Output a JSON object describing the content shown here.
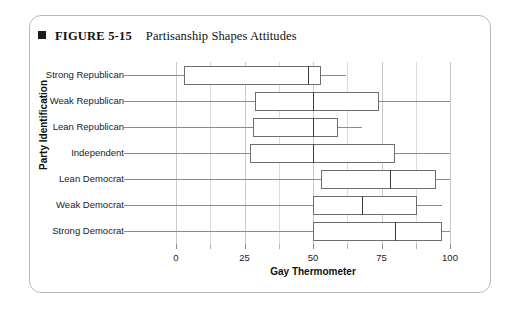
{
  "figure": {
    "bullet_icon": "filled-square-icon",
    "number": "FIGURE 5-15",
    "title": "Partisanship Shapes Attitudes"
  },
  "chart_data": {
    "type": "box",
    "title": "Partisanship Shapes Attitudes",
    "xlabel": "Gay Thermometer",
    "ylabel": "Party Identification",
    "xlim": [
      0,
      100
    ],
    "xticks": [
      0,
      25,
      50,
      75,
      100
    ],
    "xticklabels": [
      "0",
      "25",
      "50",
      "75",
      "100"
    ],
    "xminor_ticks": [
      12.5,
      37.5,
      62.5,
      87.5
    ],
    "grid": "vertical",
    "legend": "none",
    "orientation": "horizontal",
    "categories": [
      "Strong Republican",
      "Weak Republican",
      "Lean Republican",
      "Independent",
      "Lean Democrat",
      "Weak Democrat",
      "Strong Democrat"
    ],
    "boxes": [
      {
        "category": "Strong Republican",
        "whisker_low": 0,
        "q1": 3,
        "median": 48,
        "q3": 53,
        "whisker_high": 62
      },
      {
        "category": "Weak Republican",
        "whisker_low": 0,
        "q1": 29,
        "median": 50,
        "q3": 74,
        "whisker_high": 100
      },
      {
        "category": "Lean Republican",
        "whisker_low": 0,
        "q1": 28,
        "median": 50,
        "q3": 59,
        "whisker_high": 68
      },
      {
        "category": "Independent",
        "whisker_low": 0,
        "q1": 27,
        "median": 50,
        "q3": 80,
        "whisker_high": 100
      },
      {
        "category": "Lean Democrat",
        "whisker_low": 0,
        "q1": 53,
        "median": 78,
        "q3": 95,
        "whisker_high": 100
      },
      {
        "category": "Weak Democrat",
        "whisker_low": 0,
        "q1": 50,
        "median": 68,
        "q3": 88,
        "whisker_high": 97
      },
      {
        "category": "Strong Democrat",
        "whisker_low": 0,
        "q1": 50,
        "median": 80,
        "q3": 97,
        "whisker_high": 100
      }
    ]
  },
  "colors": {
    "panel_border": "#b9b9b9",
    "box_border": "#6e6e6e",
    "median_line": "#3a3a3a",
    "gridline": "#c9c9c9",
    "gridline_minor": "#dcdcdc",
    "whisker_line": "#8c8c8c",
    "text": "#111111",
    "background": "#ffffff"
  }
}
